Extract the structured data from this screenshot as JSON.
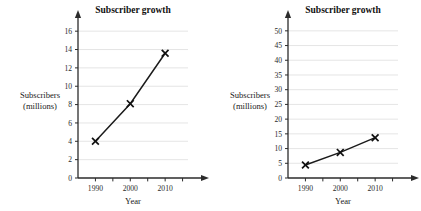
{
  "figure": {
    "background": "#ffffff",
    "line_color": "#1b1b1b",
    "grid_color": "#e2e2e2",
    "axis_color": "#2b2b2b",
    "marker_symbol": "x"
  },
  "chart_data": [
    {
      "type": "line",
      "id": "left",
      "title": "Subscriber growth",
      "xlabel": "Year",
      "ylabel": "Subscribers\n(millions)",
      "ylabel_lines": [
        "Subscribers",
        "(millions)"
      ],
      "categories": [
        "1990",
        "2000",
        "2010"
      ],
      "x": [
        1990,
        2000,
        2010
      ],
      "values": [
        4,
        8.1,
        13.6
      ],
      "xlim": [
        1985,
        2020
      ],
      "ylim": [
        0,
        17
      ],
      "yticks": [
        0,
        2,
        4,
        6,
        8,
        10,
        12,
        14,
        16
      ],
      "ytick_labels": [
        "0",
        "2",
        "4",
        "6",
        "8",
        "10",
        "12",
        "14",
        "16"
      ],
      "xticks": [
        1990,
        2000,
        2010
      ],
      "xtick_labels": [
        "1990",
        "2000",
        "2010"
      ],
      "grid": true,
      "legend": false,
      "marker": "x"
    },
    {
      "type": "line",
      "id": "right",
      "title": "Subscriber growth",
      "xlabel": "Year",
      "ylabel": "Subscribers\n(millions)",
      "ylabel_lines": [
        "Subscribers",
        "(millions)"
      ],
      "categories": [
        "1990",
        "2000",
        "2010"
      ],
      "x": [
        1990,
        2000,
        2010
      ],
      "values": [
        4.4,
        8.7,
        13.7
      ],
      "xlim": [
        1985,
        2020
      ],
      "ylim": [
        0,
        53
      ],
      "yticks": [
        0,
        5,
        10,
        15,
        20,
        25,
        30,
        35,
        40,
        45,
        50
      ],
      "ytick_labels": [
        "0",
        "5",
        "10",
        "15",
        "20",
        "25",
        "30",
        "35",
        "40",
        "45",
        "50"
      ],
      "xticks": [
        1990,
        2000,
        2010
      ],
      "xtick_labels": [
        "1990",
        "2000",
        "2010"
      ],
      "grid": true,
      "legend": false,
      "marker": "x"
    }
  ]
}
